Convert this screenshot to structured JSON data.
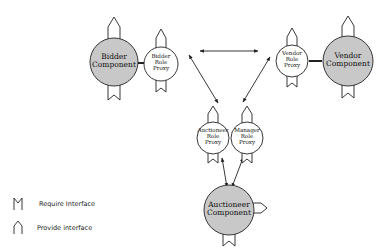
{
  "diagram": {
    "components": [
      {
        "id": "bidder",
        "label_lines": [
          "Bidder",
          "Component"
        ]
      },
      {
        "id": "vendor",
        "label_lines": [
          "Vendor",
          "Component"
        ]
      },
      {
        "id": "auctioneer",
        "label_lines": [
          "Auctioneer",
          "Component"
        ]
      }
    ],
    "proxies": [
      {
        "id": "bidder_proxy",
        "label_lines": [
          "Bidder",
          "Role",
          "Proxy"
        ]
      },
      {
        "id": "vendor_proxy",
        "label_lines": [
          "Vendor",
          "Role",
          "Proxy"
        ]
      },
      {
        "id": "auctioneer_proxy",
        "label_lines": [
          "Auctioneer",
          "Role",
          "Proxy"
        ]
      },
      {
        "id": "manager_proxy",
        "label_lines": [
          "Manager",
          "Role",
          "Proxy"
        ]
      }
    ],
    "connections": [
      {
        "from": "bidder_proxy",
        "to": "vendor_proxy",
        "type": "bidirectional"
      },
      {
        "from": "bidder_proxy",
        "to": "auctioneer_proxy",
        "type": "bidirectional"
      },
      {
        "from": "vendor_proxy",
        "to": "manager_proxy",
        "type": "bidirectional"
      },
      {
        "from": "auctioneer_component",
        "to": "auctioneer_proxy",
        "type": "bidirectional"
      },
      {
        "from": "auctioneer_component",
        "to": "manager_proxy",
        "type": "bidirectional"
      },
      {
        "from": "bidder",
        "to": "bidder_proxy",
        "type": "link"
      },
      {
        "from": "vendor",
        "to": "vendor_proxy",
        "type": "link"
      }
    ],
    "colors": {
      "component_fill": "#c8c8c8",
      "proxy_fill": "#ffffff",
      "stroke": "#222222"
    }
  },
  "legend": {
    "items": [
      {
        "icon": "require-interface-icon",
        "label": "Require Interface"
      },
      {
        "icon": "provide-interface-icon",
        "label": "Provide interface"
      }
    ]
  }
}
